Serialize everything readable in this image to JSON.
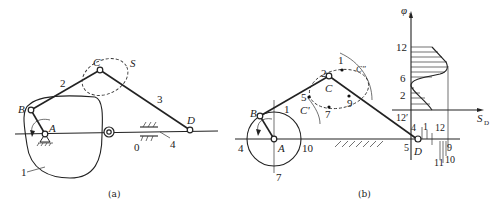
{
  "figure_a": {
    "caption": "(a)",
    "labels": {
      "A": "A",
      "B": "B",
      "C": "C",
      "D": "D",
      "S": "S",
      "link1": "1",
      "link2": "2",
      "link3": "3",
      "link4": "4",
      "frame": "0"
    }
  },
  "figure_b": {
    "caption": "(b)",
    "labels": {
      "A": "A",
      "B": "B",
      "C": "C",
      "D": "D",
      "C_prime": "C'",
      "C_double_prime": "C″",
      "crank_pos_1": "1",
      "crank_pos_4": "4",
      "crank_pos_7": "7",
      "crank_pos_10": "10",
      "coupler_pos_1": "1",
      "coupler_pos_2": "2",
      "coupler_pos_5": "5",
      "coupler_pos_7": "7",
      "coupler_pos_9": "9",
      "d_pos_4": "4",
      "d_pos_5": "5",
      "d_pos_1": "1",
      "d_pos_12": "12",
      "d_pos_12p": "12′",
      "d_pos_9": "9",
      "d_pos_10": "10",
      "d_pos_11": "11"
    },
    "graph": {
      "y_axis_label": "φ",
      "y_axis_sub": "1",
      "x_axis_label": "S",
      "x_axis_sub": "D",
      "y_ticks": [
        "2",
        "6",
        "12"
      ]
    }
  }
}
